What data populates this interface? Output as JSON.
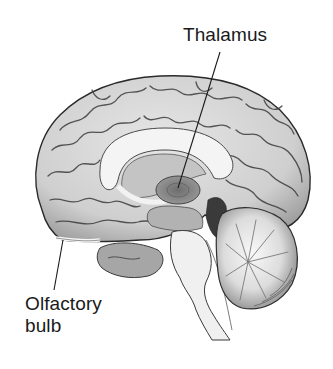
{
  "figure": {
    "type": "anatomical-illustration",
    "background_color": "#ffffff",
    "ink_color": "#1a1a1a"
  },
  "labels": {
    "thalamus": {
      "text": "Thalamus"
    },
    "olfactory_bulb": {
      "line1": "Olfactory",
      "line2": "bulb"
    }
  },
  "structures": [
    "cerebral-cortex",
    "corpus-callosum",
    "lateral-ventricle",
    "thalamus",
    "hypothalamus",
    "olfactory-bulb",
    "temporal-lobe",
    "midbrain",
    "pons",
    "medulla",
    "cerebellum",
    "fourth-ventricle"
  ]
}
